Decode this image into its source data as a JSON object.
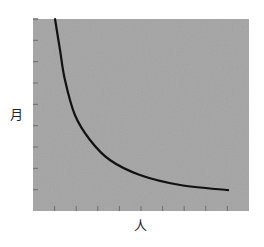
{
  "chart_data": {
    "type": "line",
    "title": "",
    "xlabel": "人",
    "ylabel": "月",
    "xlim": [
      0,
      10
    ],
    "ylim": [
      0,
      9
    ],
    "grid": false,
    "legend": null,
    "x_ticks": [
      1,
      2,
      3,
      4,
      5,
      6,
      7,
      8,
      9
    ],
    "y_ticks": [
      1,
      2,
      3,
      4,
      5,
      6,
      7,
      8,
      9
    ],
    "tick_labels_shown": false,
    "series": [
      {
        "name": "months vs people",
        "x": [
          1.02,
          1.25,
          1.48,
          1.94,
          2.64,
          3.56,
          4.95,
          6.81,
          9.03
        ],
        "y": [
          9.0,
          7.55,
          6.14,
          4.5,
          3.33,
          2.39,
          1.69,
          1.22,
          0.98
        ]
      }
    ]
  },
  "style": {
    "plot_background": "#a4a4a4",
    "line_color": "#111111",
    "tick_color": "#6e6e6e",
    "page_background": "#ffffff"
  },
  "labels": {
    "y_axis": "月",
    "x_axis": "人"
  }
}
